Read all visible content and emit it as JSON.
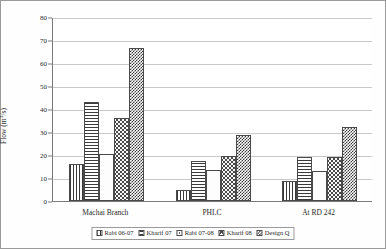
{
  "chart_data": {
    "type": "bar",
    "title": "",
    "xlabel": "",
    "ylabel": "Flow (m3/s)",
    "ylabel_prefix": "Flow (m",
    "ylabel_sup": "3",
    "ylabel_suffix": "/s)",
    "categories": [
      "Machai Branch",
      "PHLC",
      "At RD 242"
    ],
    "ylim": [
      0,
      80
    ],
    "yticks": [
      0,
      10,
      20,
      30,
      40,
      50,
      60,
      70,
      80
    ],
    "grid": true,
    "legend_position": "bottom",
    "series": [
      {
        "name": "Rabi 06-07",
        "pattern": "vertical-lines",
        "values": [
          16.2,
          4.7,
          8.8
        ]
      },
      {
        "name": "Kharif 07",
        "pattern": "horizontal-lines",
        "values": [
          43.2,
          17.5,
          19.3
        ]
      },
      {
        "name": "Rabi 07-08",
        "pattern": "dots",
        "values": [
          20.5,
          13.4,
          13.2
        ]
      },
      {
        "name": "Kharif 08",
        "pattern": "zigzag",
        "values": [
          36.2,
          19.4,
          19.2
        ]
      },
      {
        "name": "Design Q",
        "pattern": "checkerboard",
        "values": [
          66.7,
          28.6,
          32.2
        ]
      }
    ]
  },
  "colors": {
    "axis": "#7b7b7b",
    "grid": "#c9c9c9",
    "text": "#2a2a2a",
    "border": "#9a9a9a",
    "ink": "#3a3a3a"
  }
}
